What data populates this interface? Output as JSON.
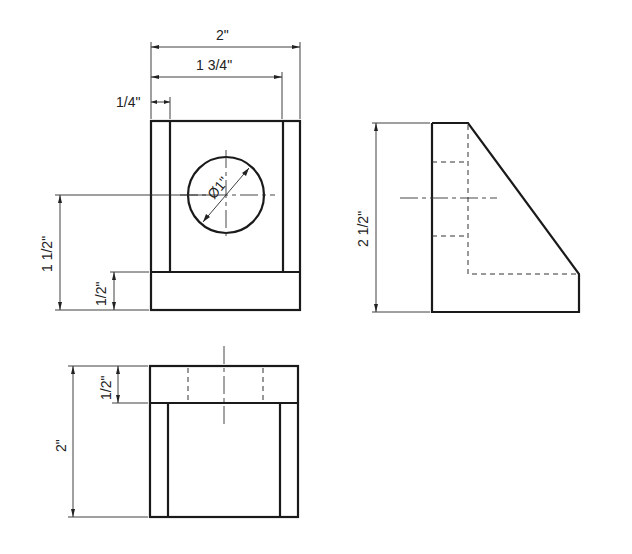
{
  "drawing": {
    "type": "orthographic-projection",
    "views": [
      "front",
      "right-side",
      "top"
    ]
  },
  "dimensions": {
    "front_overall_width": "2\"",
    "front_inner_width": "1 3/4\"",
    "front_slot_width": "1/4\"",
    "hole_diameter": "Ø1\"",
    "front_hole_center_height": "1 1/2\"",
    "front_base_height": "1/2\"",
    "side_overall_height": "2 1/2\"",
    "top_overall_depth": "2\"",
    "top_base_thickness": "1/2\""
  }
}
